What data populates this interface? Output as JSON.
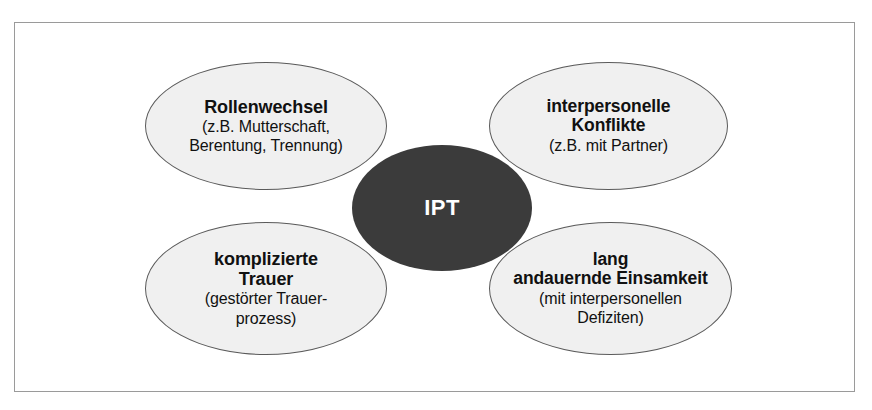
{
  "diagram": {
    "center": {
      "label": "IPT",
      "fill_color": "#3b3b3b",
      "text_color": "#ffffff"
    },
    "frame_color": "#9a9a9a",
    "node_fill_color": "#f0f0f0",
    "node_border_color": "#5a5a5a",
    "nodes": [
      {
        "id": "rollenwechsel",
        "position": "top-left",
        "title": "Rollenwechsel",
        "sub_lines": [
          "(z.B. Mutterschaft,",
          "Berentung, Trennung)"
        ]
      },
      {
        "id": "konflikte",
        "position": "top-right",
        "title_lines": [
          "interpersonelle",
          "Konflikte"
        ],
        "sub_lines": [
          "(z.B. mit Partner)"
        ]
      },
      {
        "id": "trauer",
        "position": "bottom-left",
        "title_lines": [
          "komplizierte",
          "Trauer"
        ],
        "sub_lines": [
          "(gestörter Trauer-",
          "prozess)"
        ]
      },
      {
        "id": "einsamkeit",
        "position": "bottom-right",
        "title_lines": [
          "lang",
          "andauernde Einsamkeit"
        ],
        "sub_lines": [
          "(mit interpersonellen",
          "Defiziten)"
        ]
      }
    ]
  }
}
